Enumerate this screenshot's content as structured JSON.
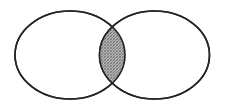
{
  "figure": {
    "type": "venn-diagram",
    "title": "Two-set Venn diagram with shaded intersection",
    "canvas": {
      "width": 225,
      "height": 108,
      "background_color": "#ffffff"
    },
    "style": {
      "outline_color": "#242424",
      "outline_width": 1.6,
      "set_fill_color": "#ffffff",
      "intersection_fill_color": "#a8a8a8",
      "intersection_pattern": "cross-hatch-halftone",
      "intersection_pattern_color": "#6f6f6f"
    },
    "sets": [
      {
        "id": "set-left",
        "label": "",
        "shape": "ellipse",
        "center_x": 70,
        "center_y": 55,
        "radius_x": 55,
        "radius_y": 44,
        "fill": "#ffffff",
        "shaded": false
      },
      {
        "id": "set-right",
        "label": "",
        "shape": "ellipse",
        "center_x": 154.5,
        "center_y": 55,
        "radius_x": 55,
        "radius_y": 44,
        "fill": "#ffffff",
        "shaded": false
      }
    ],
    "regions": [
      {
        "id": "region-left-only",
        "label": "",
        "shaded": false,
        "fill": "#ffffff"
      },
      {
        "id": "region-intersection",
        "label": "",
        "shaded": true,
        "fill": "#a8a8a8",
        "bounds": {
          "left_x": 99.5,
          "right_x": 125,
          "top_y": 27,
          "bottom_y": 84
        }
      },
      {
        "id": "region-right-only",
        "label": "",
        "shaded": false,
        "fill": "#ffffff"
      }
    ],
    "labels": []
  }
}
